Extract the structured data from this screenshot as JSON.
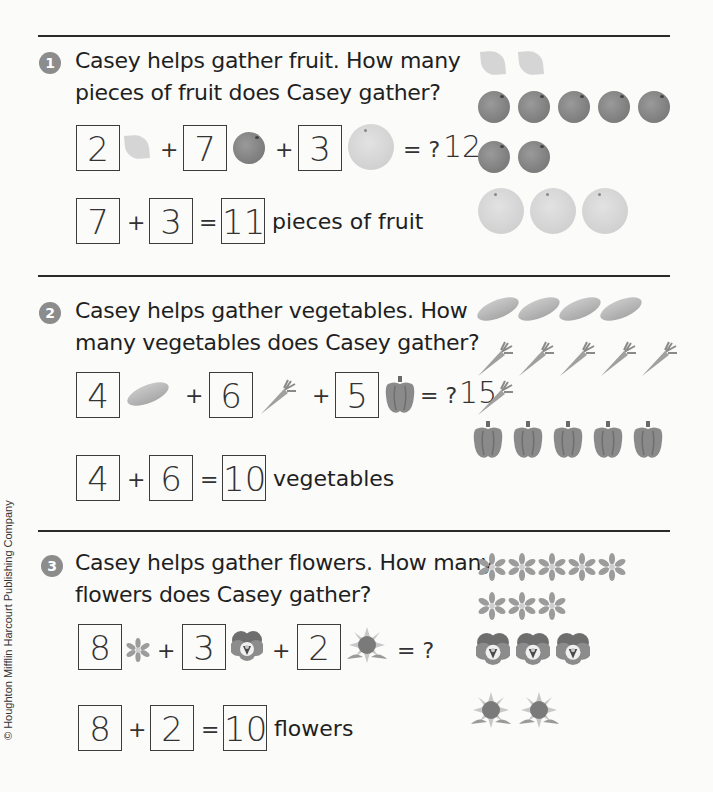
{
  "copyright": "© Houghton Mifflin Harcourt Publishing Company",
  "problems": [
    {
      "number": "1",
      "question_line1": "Casey helps gather fruit. How many",
      "question_line2": "pieces of fruit does Casey gather?",
      "equation": {
        "addends": [
          {
            "value": "2",
            "icon": "lemon-icon"
          },
          {
            "value": "7",
            "icon": "plum-icon"
          },
          {
            "value": "3",
            "icon": "grapefruit-icon"
          }
        ],
        "plus": "+",
        "equals_question": "= ?",
        "handwritten_answer": "12"
      },
      "answer": {
        "a": "7",
        "b": "3",
        "sum": "11",
        "plus": "+",
        "equals": "=",
        "unit": "pieces of fruit"
      },
      "picture_rows": [
        {
          "icon": "lemon-icon",
          "count": 2
        },
        {
          "icon": "plum-icon",
          "count": 5
        },
        {
          "icon": "plum-icon",
          "count": 2
        },
        {
          "icon": "grapefruit-icon",
          "count": 3
        }
      ]
    },
    {
      "number": "2",
      "question_line1": "Casey helps gather vegetables. How",
      "question_line2": "many vegetables does Casey gather?",
      "equation": {
        "addends": [
          {
            "value": "4",
            "icon": "squash-icon"
          },
          {
            "value": "6",
            "icon": "carrot-icon"
          },
          {
            "value": "5",
            "icon": "pepper-icon"
          }
        ],
        "plus": "+",
        "equals_question": "= ?",
        "handwritten_answer": "15"
      },
      "answer": {
        "a": "4",
        "b": "6",
        "sum": "10",
        "plus": "+",
        "equals": "=",
        "unit": "vegetables"
      },
      "picture_rows": [
        {
          "icon": "squash-icon",
          "count": 4
        },
        {
          "icon": "carrot-icon",
          "count": 5
        },
        {
          "icon": "carrot-icon",
          "count": 1
        },
        {
          "icon": "pepper-icon",
          "count": 5
        }
      ]
    },
    {
      "number": "3",
      "question_line1": "Casey helps gather flowers. How many",
      "question_line2": "flowers does Casey gather?",
      "equation": {
        "addends": [
          {
            "value": "8",
            "icon": "daisy-icon"
          },
          {
            "value": "3",
            "icon": "pansy-icon"
          },
          {
            "value": "2",
            "icon": "sunflower-icon"
          }
        ],
        "plus": "+",
        "equals_question": "= ?",
        "handwritten_answer": ""
      },
      "answer": {
        "a": "8",
        "b": "2",
        "sum": "10",
        "plus": "+",
        "equals": "=",
        "unit": "flowers"
      },
      "picture_rows": [
        {
          "icon": "daisy-icon",
          "count": 5
        },
        {
          "icon": "daisy-icon",
          "count": 3
        },
        {
          "icon": "pansy-icon",
          "count": 3
        },
        {
          "icon": "sunflower-icon",
          "count": 2
        }
      ]
    }
  ]
}
